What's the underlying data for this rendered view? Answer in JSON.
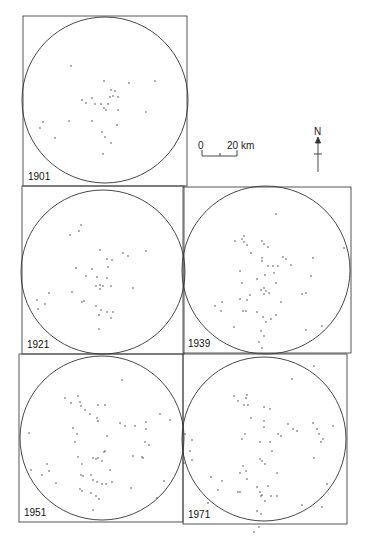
{
  "figure": {
    "background": "#ffffff",
    "ink": "#222222",
    "frames": [
      {
        "id": "1901",
        "label": "1901",
        "x": 23,
        "y": 16,
        "w": 164,
        "h": 170,
        "cx": 105,
        "cy": 100,
        "r": 83,
        "dots": [
          [
            -34,
            -34
          ],
          [
            -1,
            -19
          ],
          [
            24,
            -17
          ],
          [
            50,
            -19
          ],
          [
            6,
            -10
          ],
          [
            10,
            -9
          ],
          [
            5,
            -3
          ],
          [
            8,
            -4
          ],
          [
            13,
            -3
          ],
          [
            -23,
            0
          ],
          [
            -13,
            -2
          ],
          [
            -19,
            3
          ],
          [
            -10,
            4
          ],
          [
            -4,
            4
          ],
          [
            3,
            4
          ],
          [
            -1,
            8
          ],
          [
            1,
            10
          ],
          [
            13,
            10
          ],
          [
            41,
            12
          ],
          [
            -36,
            21
          ],
          [
            -13,
            21
          ],
          [
            -62,
            22
          ],
          [
            -65,
            28
          ],
          [
            12,
            25
          ],
          [
            -3,
            32
          ],
          [
            0,
            37
          ],
          [
            6,
            43
          ],
          [
            -2,
            54
          ],
          [
            -50,
            38
          ]
        ]
      },
      {
        "id": "1921",
        "label": "1921",
        "x": 22,
        "y": 186,
        "w": 162,
        "h": 168,
        "cx": 103,
        "cy": 272,
        "r": 82,
        "dots": [
          [
            -22,
            -47
          ],
          [
            -24,
            -41
          ],
          [
            -33,
            -37
          ],
          [
            -3,
            -22
          ],
          [
            20,
            -19
          ],
          [
            25,
            -16
          ],
          [
            4,
            -13
          ],
          [
            9,
            -12
          ],
          [
            43,
            -21
          ],
          [
            5,
            -5
          ],
          [
            -27,
            -4
          ],
          [
            -11,
            -3
          ],
          [
            -17,
            4
          ],
          [
            -6,
            5
          ],
          [
            4,
            6
          ],
          [
            -7,
            14
          ],
          [
            -3,
            13
          ],
          [
            0,
            14
          ],
          [
            -3,
            17
          ],
          [
            8,
            14
          ],
          [
            30,
            16
          ],
          [
            -54,
            21
          ],
          [
            -31,
            20
          ],
          [
            -21,
            30
          ],
          [
            -19,
            29
          ],
          [
            -7,
            34
          ],
          [
            -2,
            38
          ],
          [
            4,
            40
          ],
          [
            -4,
            43
          ],
          [
            8,
            46
          ],
          [
            10,
            40
          ],
          [
            -65,
            37
          ],
          [
            -66,
            28
          ],
          [
            -58,
            32
          ],
          [
            -4,
            57
          ]
        ]
      },
      {
        "id": "1939",
        "label": "1939",
        "x": 183,
        "y": 187,
        "w": 168,
        "h": 166,
        "cx": 266,
        "cy": 270,
        "r": 84,
        "dots": [
          [
            10,
            -56
          ],
          [
            -22,
            -34
          ],
          [
            -24,
            -31
          ],
          [
            -22,
            -28
          ],
          [
            -31,
            -29
          ],
          [
            -19,
            -25
          ],
          [
            -4,
            -29
          ],
          [
            -2,
            -26
          ],
          [
            2,
            -23
          ],
          [
            -15,
            -17
          ],
          [
            17,
            -13
          ],
          [
            20,
            -11
          ],
          [
            47,
            -12
          ],
          [
            -4,
            -12
          ],
          [
            -4,
            -9
          ],
          [
            2,
            -4
          ],
          [
            7,
            -4
          ],
          [
            12,
            -4
          ],
          [
            25,
            -5
          ],
          [
            -1,
            5
          ],
          [
            8,
            3
          ],
          [
            -26,
            1
          ],
          [
            45,
            6
          ],
          [
            -9,
            9
          ],
          [
            10,
            13
          ],
          [
            -24,
            13
          ],
          [
            -2,
            18
          ],
          [
            -5,
            20
          ],
          [
            0,
            21
          ],
          [
            -2,
            24
          ],
          [
            3,
            23
          ],
          [
            36,
            24
          ],
          [
            40,
            23
          ],
          [
            -16,
            25
          ],
          [
            -19,
            30
          ],
          [
            -26,
            29
          ],
          [
            15,
            32
          ],
          [
            -44,
            32
          ],
          [
            -45,
            41
          ],
          [
            -51,
            36
          ],
          [
            -23,
            41
          ],
          [
            -20,
            41
          ],
          [
            -9,
            42
          ],
          [
            -3,
            47
          ],
          [
            0,
            52
          ],
          [
            5,
            49
          ],
          [
            -32,
            57
          ],
          [
            -5,
            61
          ],
          [
            10,
            45
          ],
          [
            56,
            56
          ],
          [
            40,
            60
          ],
          [
            -7,
            72
          ],
          [
            -4,
            78
          ],
          [
            -2,
            66
          ],
          [
            78,
            -22
          ]
        ]
      },
      {
        "id": "1951",
        "label": "1951",
        "x": 19,
        "y": 354,
        "w": 164,
        "h": 168,
        "cx": 102,
        "cy": 438,
        "r": 82,
        "dots": [
          [
            20,
            -58
          ],
          [
            -37,
            -40
          ],
          [
            -24,
            -42
          ],
          [
            -31,
            -35
          ],
          [
            -22,
            -36
          ],
          [
            -21,
            -32
          ],
          [
            -17,
            -28
          ],
          [
            -4,
            -33
          ],
          [
            3,
            -33
          ],
          [
            -12,
            -24
          ],
          [
            58,
            -24
          ],
          [
            68,
            -18
          ],
          [
            -5,
            -20
          ],
          [
            -4,
            -17
          ],
          [
            18,
            -15
          ],
          [
            23,
            -12
          ],
          [
            33,
            -12
          ],
          [
            44,
            -16
          ],
          [
            44,
            -9
          ],
          [
            -29,
            -10
          ],
          [
            -25,
            -4
          ],
          [
            5,
            -2
          ],
          [
            -27,
            4
          ],
          [
            43,
            4
          ],
          [
            47,
            7
          ],
          [
            3,
            13
          ],
          [
            2,
            14
          ],
          [
            -9,
            20
          ],
          [
            -6,
            21
          ],
          [
            -4,
            20
          ],
          [
            0,
            23
          ],
          [
            31,
            18
          ],
          [
            40,
            19
          ],
          [
            41,
            20
          ],
          [
            -24,
            19
          ],
          [
            -20,
            26
          ],
          [
            8,
            32
          ],
          [
            -55,
            26
          ],
          [
            -53,
            33
          ],
          [
            -60,
            37
          ],
          [
            -71,
            32
          ],
          [
            -73,
            -5
          ],
          [
            -21,
            37
          ],
          [
            -19,
            38
          ],
          [
            -11,
            37
          ],
          [
            -9,
            42
          ],
          [
            -5,
            44
          ],
          [
            0,
            46
          ],
          [
            4,
            46
          ],
          [
            10,
            44
          ],
          [
            -46,
            45
          ],
          [
            -22,
            51
          ],
          [
            -20,
            53
          ],
          [
            -11,
            55
          ],
          [
            -6,
            58
          ],
          [
            -3,
            61
          ],
          [
            29,
            50
          ],
          [
            55,
            60
          ],
          [
            62,
            43
          ],
          [
            -9,
            72
          ]
        ]
      },
      {
        "id": "1971",
        "label": "1971",
        "x": 183,
        "y": 354,
        "w": 164,
        "h": 170,
        "cx": 264,
        "cy": 439,
        "r": 82,
        "dots": [
          [
            50,
            -73
          ],
          [
            28,
            -60
          ],
          [
            -30,
            -43
          ],
          [
            -17,
            -44
          ],
          [
            -18,
            -41
          ],
          [
            -26,
            -38
          ],
          [
            -20,
            -34
          ],
          [
            -16,
            -34
          ],
          [
            0,
            -32
          ],
          [
            6,
            -30
          ],
          [
            -13,
            -21
          ],
          [
            69,
            -13
          ],
          [
            49,
            -16
          ],
          [
            53,
            -10
          ],
          [
            0,
            -18
          ],
          [
            0,
            -12
          ],
          [
            24,
            -15
          ],
          [
            29,
            -10
          ],
          [
            33,
            -8
          ],
          [
            17,
            -3
          ],
          [
            14,
            -5
          ],
          [
            -19,
            -5
          ],
          [
            -22,
            0
          ],
          [
            -4,
            3
          ],
          [
            6,
            3
          ],
          [
            57,
            3
          ],
          [
            59,
            0
          ],
          [
            55,
            -5
          ],
          [
            8,
            12
          ],
          [
            -2,
            22
          ],
          [
            1,
            25
          ],
          [
            -4,
            20
          ],
          [
            -21,
            27
          ],
          [
            -18,
            32
          ],
          [
            -24,
            34
          ],
          [
            -17,
            40
          ],
          [
            13,
            34
          ],
          [
            50,
            19
          ],
          [
            -42,
            42
          ],
          [
            -53,
            38
          ],
          [
            -46,
            51
          ],
          [
            -26,
            53
          ],
          [
            -24,
            53
          ],
          [
            -7,
            48
          ],
          [
            -4,
            53
          ],
          [
            -2,
            56
          ],
          [
            -3,
            57
          ],
          [
            1,
            62
          ],
          [
            7,
            57
          ],
          [
            13,
            57
          ],
          [
            4,
            47
          ],
          [
            38,
            66
          ],
          [
            63,
            45
          ],
          [
            -7,
            72
          ],
          [
            -3,
            75
          ],
          [
            -56,
            64
          ],
          [
            -72,
            21
          ],
          [
            -80,
            24
          ],
          [
            -74,
            12
          ],
          [
            -72,
            1
          ],
          [
            -79,
            -5
          ],
          [
            58,
            68
          ],
          [
            -5,
            88
          ],
          [
            -10,
            93
          ]
        ]
      }
    ],
    "scale_bar": {
      "zero_label": "0",
      "end_label": "20 km",
      "x0": 202,
      "x1": 237,
      "y": 155
    },
    "north_arrow": {
      "label": "N",
      "x": 318,
      "y_top": 133,
      "y_bottom": 172
    }
  }
}
